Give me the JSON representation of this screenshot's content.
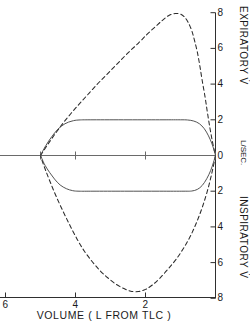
{
  "chart_data": {
    "type": "line",
    "title": "",
    "xlabel": "VOLUME ( L FROM TLC )",
    "ylabel_upper": "EXPIRATORY V̇",
    "ylabel_center": "L/SEC.",
    "ylabel_lower": "INSPIRATORY V̇",
    "xlim": [
      6.6,
      -0.3
    ],
    "ylim": [
      -8.4,
      8.4
    ],
    "grid": false,
    "legend": "none",
    "x_ticks": [
      6,
      4,
      2
    ],
    "x_tick_labels": [
      "6",
      "4",
      "2"
    ],
    "y_ticks": [
      8,
      6,
      4,
      2,
      0,
      -2,
      -4,
      -6,
      -8
    ],
    "y_tick_labels": [
      "8",
      "6",
      "4",
      "2",
      "0",
      "2",
      "4",
      "6",
      "8"
    ],
    "zero_line_x_range": [
      6.4,
      0.0
    ],
    "zero_line_ticks": [
      6.4,
      5.0,
      4.0,
      2.0,
      0.0
    ],
    "series": [
      {
        "name": "maximal-flow-volume-loop",
        "style": "dashed",
        "color": "#2b2b2b",
        "points_expiratory": [
          [
            5.0,
            0.0
          ],
          [
            4.8,
            0.6
          ],
          [
            4.55,
            1.3
          ],
          [
            4.3,
            1.95
          ],
          [
            4.0,
            2.65
          ],
          [
            3.7,
            3.3
          ],
          [
            3.4,
            3.95
          ],
          [
            3.1,
            4.55
          ],
          [
            2.8,
            5.15
          ],
          [
            2.5,
            5.75
          ],
          [
            2.2,
            6.3
          ],
          [
            1.95,
            6.8
          ],
          [
            1.7,
            7.25
          ],
          [
            1.5,
            7.6
          ],
          [
            1.32,
            7.86
          ],
          [
            1.15,
            7.95
          ],
          [
            1.0,
            7.92
          ],
          [
            0.88,
            7.75
          ],
          [
            0.78,
            7.45
          ],
          [
            0.68,
            7.0
          ],
          [
            0.6,
            6.45
          ],
          [
            0.52,
            5.8
          ],
          [
            0.45,
            5.05
          ],
          [
            0.38,
            4.2
          ],
          [
            0.3,
            3.3
          ],
          [
            0.23,
            2.4
          ],
          [
            0.16,
            1.55
          ],
          [
            0.09,
            0.8
          ],
          [
            0.03,
            0.25
          ],
          [
            0.0,
            0.0
          ]
        ],
        "points_inspiratory": [
          [
            0.0,
            0.0
          ],
          [
            0.1,
            -0.95
          ],
          [
            0.22,
            -1.9
          ],
          [
            0.36,
            -2.8
          ],
          [
            0.52,
            -3.65
          ],
          [
            0.7,
            -4.45
          ],
          [
            0.9,
            -5.15
          ],
          [
            1.12,
            -5.8
          ],
          [
            1.35,
            -6.35
          ],
          [
            1.58,
            -6.85
          ],
          [
            1.8,
            -7.25
          ],
          [
            2.0,
            -7.5
          ],
          [
            2.2,
            -7.62
          ],
          [
            2.42,
            -7.6
          ],
          [
            2.62,
            -7.45
          ],
          [
            2.85,
            -7.2
          ],
          [
            3.08,
            -6.85
          ],
          [
            3.3,
            -6.45
          ],
          [
            3.52,
            -5.95
          ],
          [
            3.75,
            -5.35
          ],
          [
            3.95,
            -4.7
          ],
          [
            4.15,
            -3.95
          ],
          [
            4.35,
            -3.15
          ],
          [
            4.55,
            -2.3
          ],
          [
            4.72,
            -1.5
          ],
          [
            4.86,
            -0.8
          ],
          [
            4.96,
            -0.25
          ],
          [
            5.0,
            0.0
          ]
        ]
      },
      {
        "name": "tidal-breathing-loop",
        "style": "solid",
        "color": "#4a4a4a",
        "points_expiratory": [
          [
            5.0,
            0.0
          ],
          [
            4.85,
            0.55
          ],
          [
            4.68,
            1.05
          ],
          [
            4.5,
            1.48
          ],
          [
            4.3,
            1.78
          ],
          [
            4.1,
            1.93
          ],
          [
            3.9,
            1.99
          ],
          [
            3.5,
            2.0
          ],
          [
            2.5,
            2.0
          ],
          [
            1.5,
            2.0
          ],
          [
            1.0,
            2.0
          ],
          [
            0.8,
            1.99
          ],
          [
            0.62,
            1.93
          ],
          [
            0.46,
            1.78
          ],
          [
            0.32,
            1.5
          ],
          [
            0.2,
            1.1
          ],
          [
            0.1,
            0.65
          ],
          [
            0.03,
            0.22
          ],
          [
            0.0,
            0.0
          ]
        ],
        "points_inspiratory": [
          [
            0.0,
            0.0
          ],
          [
            0.06,
            -0.4
          ],
          [
            0.14,
            -0.85
          ],
          [
            0.25,
            -1.3
          ],
          [
            0.38,
            -1.68
          ],
          [
            0.52,
            -1.9
          ],
          [
            0.68,
            -1.99
          ],
          [
            0.9,
            -2.0
          ],
          [
            1.6,
            -2.0
          ],
          [
            2.6,
            -2.0
          ],
          [
            3.5,
            -2.0
          ],
          [
            3.9,
            -2.0
          ],
          [
            4.08,
            -1.97
          ],
          [
            4.26,
            -1.86
          ],
          [
            4.44,
            -1.65
          ],
          [
            4.6,
            -1.32
          ],
          [
            4.74,
            -0.95
          ],
          [
            4.87,
            -0.55
          ],
          [
            4.96,
            -0.18
          ],
          [
            5.0,
            0.0
          ]
        ]
      }
    ]
  }
}
